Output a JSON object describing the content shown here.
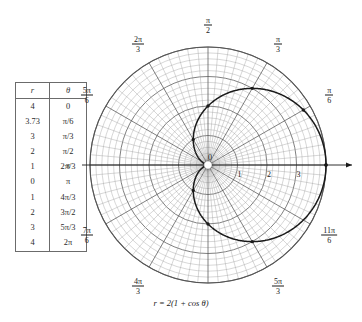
{
  "figure": {
    "caption": "r = 2(1 + cos θ)",
    "equation_label": "r = 2(1 + cos θ)"
  },
  "table": {
    "name": "polar-coordinate-table",
    "columns": [
      "r",
      "θ"
    ],
    "rows": [
      {
        "r": "4",
        "theta": "0"
      },
      {
        "r": "3.73",
        "theta": "π/6"
      },
      {
        "r": "3",
        "theta": "π/3"
      },
      {
        "r": "2",
        "theta": "π/2"
      },
      {
        "r": "1",
        "theta": "2π/3"
      },
      {
        "r": "0",
        "theta": "π"
      },
      {
        "r": "1",
        "theta": "4π/3"
      },
      {
        "r": "2",
        "theta": "3π/2"
      },
      {
        "r": "3",
        "theta": "5π/3"
      },
      {
        "r": "4",
        "theta": "2π"
      }
    ]
  },
  "chart_data": {
    "type": "line",
    "subtype": "polar",
    "title": "",
    "equation": "r = 2(1 + cos θ)",
    "curve_name": "cardioid",
    "xlabel": "",
    "ylabel": "",
    "theta_unit": "radians",
    "rlim": [
      0,
      4
    ],
    "r_ticks": [
      1,
      2,
      3
    ],
    "r_tick_labels": [
      "1",
      "2",
      "3"
    ],
    "pole_label": "0",
    "grid": true,
    "angular_divisions": 72,
    "radial_rings": 20,
    "axis_arrow": true,
    "angle_labels": [
      {
        "value": "π/2",
        "num": "π",
        "den": "2",
        "deg": 90
      },
      {
        "value": "π/3",
        "num": "π",
        "den": "3",
        "deg": 60
      },
      {
        "value": "π/6",
        "num": "π",
        "den": "6",
        "deg": 30
      },
      {
        "value": "2π/3",
        "num": "2π",
        "den": "3",
        "deg": 120
      },
      {
        "value": "5π/6",
        "num": "5π",
        "den": "6",
        "deg": 150
      },
      {
        "value": "π",
        "num": "π",
        "den": "",
        "deg": 180
      },
      {
        "value": "7π/6",
        "num": "7π",
        "den": "6",
        "deg": 210
      },
      {
        "value": "4π/3",
        "num": "4π",
        "den": "3",
        "deg": 240
      },
      {
        "value": "5π/3",
        "num": "5π",
        "den": "3",
        "deg": 300
      },
      {
        "value": "11π/6",
        "num": "11π",
        "den": "6",
        "deg": 330
      }
    ],
    "points": [
      {
        "theta_label": "0",
        "theta_deg": 0,
        "r": 4.0
      },
      {
        "theta_label": "π/6",
        "theta_deg": 30,
        "r": 3.73
      },
      {
        "theta_label": "π/3",
        "theta_deg": 60,
        "r": 3.0
      },
      {
        "theta_label": "π/2",
        "theta_deg": 90,
        "r": 2.0
      },
      {
        "theta_label": "2π/3",
        "theta_deg": 120,
        "r": 1.0
      },
      {
        "theta_label": "π",
        "theta_deg": 180,
        "r": 0.0
      },
      {
        "theta_label": "4π/3",
        "theta_deg": 240,
        "r": 1.0
      },
      {
        "theta_label": "3π/2",
        "theta_deg": 270,
        "r": 2.0
      },
      {
        "theta_label": "5π/3",
        "theta_deg": 300,
        "r": 3.0
      },
      {
        "theta_label": "2π",
        "theta_deg": 360,
        "r": 4.0
      }
    ],
    "colors": {
      "curve": "#1a1a1a",
      "grid_major": "#555555",
      "grid_minor": "#9a9a9a",
      "axis": "#1a1a1a",
      "background": "#ffffff"
    }
  }
}
